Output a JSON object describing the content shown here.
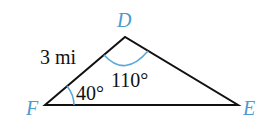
{
  "diagram": {
    "type": "triangle",
    "colors": {
      "edge": "#111111",
      "vertex_label": "#4a9bd0",
      "arc": "#5aa8d8"
    },
    "vertices": [
      {
        "name": "D",
        "x": 125,
        "y": 37
      },
      {
        "name": "E",
        "x": 238,
        "y": 105
      },
      {
        "name": "F",
        "x": 45,
        "y": 105
      }
    ],
    "side_label": "3 mi",
    "angle_D": "110°",
    "angle_F": "40°"
  }
}
